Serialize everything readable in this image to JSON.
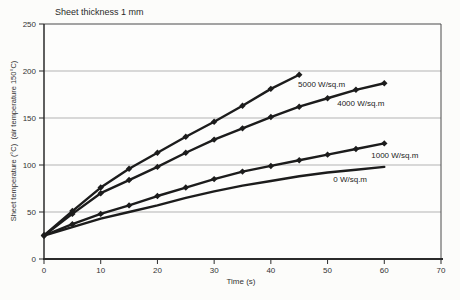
{
  "chart_data": {
    "type": "line",
    "title": "Sheet thickness 1 mm",
    "xlabel": "Time (s)",
    "ylabel": "Sheet temperature (°C)  (air temperature 150°C)",
    "xlim": [
      0,
      70
    ],
    "ylim": [
      0,
      250
    ],
    "xticks": [
      0,
      10,
      20,
      30,
      40,
      50,
      60,
      70
    ],
    "yticks": [
      0,
      50,
      100,
      150,
      200,
      250
    ],
    "grid": "horizontal-only",
    "legend_position": "inline-labels",
    "line_color": "#1c1c1c",
    "gridline_color": "#b3b3b3",
    "series": [
      {
        "name": "5000 W/sq.m",
        "marker": "diamond",
        "x": [
          0,
          5,
          10,
          15,
          20,
          25,
          30,
          35,
          40,
          45
        ],
        "y": [
          25,
          51,
          76,
          96,
          113,
          130,
          146,
          163,
          181,
          196
        ],
        "label_at": {
          "t": 44.8,
          "temp": 186
        }
      },
      {
        "name": "4000 W/sq.m",
        "marker": "diamond",
        "x": [
          0,
          5,
          10,
          15,
          20,
          25,
          30,
          35,
          40,
          45,
          50,
          55,
          60
        ],
        "y": [
          25,
          48,
          70,
          84,
          98,
          113,
          127,
          139,
          151,
          162,
          171,
          180,
          187
        ],
        "label_at": {
          "t": 51.7,
          "temp": 166
        }
      },
      {
        "name": "1000 W/sq.m",
        "marker": "diamond",
        "x": [
          0,
          5,
          10,
          15,
          20,
          25,
          30,
          35,
          40,
          45,
          50,
          55,
          60
        ],
        "y": [
          25,
          37,
          48,
          57,
          67,
          76,
          85,
          93,
          99,
          105,
          111,
          117,
          123
        ],
        "label_at": {
          "t": 57.7,
          "temp": 111
        }
      },
      {
        "name": "0 W/sq.m",
        "marker": "none",
        "x": [
          0,
          5,
          10,
          15,
          20,
          25,
          30,
          35,
          40,
          45,
          50,
          55,
          60
        ],
        "y": [
          25,
          34,
          43,
          50,
          57,
          65,
          72,
          78,
          83,
          88,
          92,
          95,
          98
        ],
        "label_at": {
          "t": 51.0,
          "temp": 85
        }
      }
    ]
  }
}
